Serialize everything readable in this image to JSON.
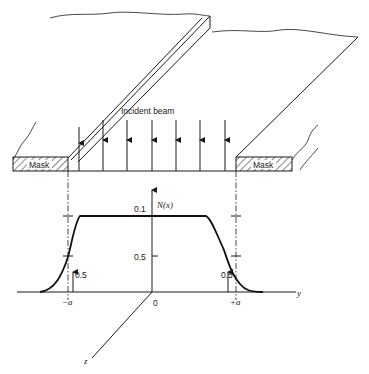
{
  "labels": {
    "incident_beam": "Incident beam",
    "mask_left": "Mask",
    "mask_right": "Mask",
    "y_axis_label": "N(x)",
    "tick_top": "0.1",
    "tick_mid": "0.5",
    "half_left": "0.5",
    "half_right": "0.5",
    "x_minus_a": "−a",
    "x_origin": "0",
    "x_plus_a": "+a",
    "y_axis": "y",
    "z_axis": "z"
  }
}
